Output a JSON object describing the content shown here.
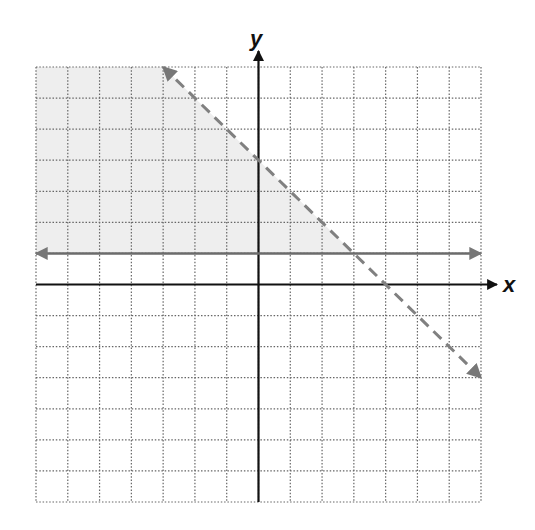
{
  "chart_data": {
    "type": "line",
    "title": "",
    "xlabel": "x",
    "ylabel": "y",
    "xlim": [
      -7,
      7
    ],
    "ylim": [
      -7,
      7
    ],
    "grid": true,
    "grid_style": "dotted",
    "tick_labels": false,
    "series": [
      {
        "name": "boundary y = 1",
        "style": "solid",
        "color": "#6b6b6b",
        "arrows": "both",
        "points": [
          [
            -7,
            1
          ],
          [
            7,
            1
          ]
        ]
      },
      {
        "name": "boundary y = -x + 4",
        "style": "dashed",
        "color": "#808080",
        "arrows": "both",
        "points": [
          [
            -3,
            7
          ],
          [
            7,
            -3
          ]
        ]
      }
    ],
    "shaded_region": {
      "description": "y >= 1 and x + y < 4",
      "color": "#eeeeee",
      "polygon": [
        [
          -7,
          1
        ],
        [
          3,
          1
        ],
        [
          -3,
          7
        ],
        [
          -7,
          7
        ]
      ]
    }
  },
  "labels": {
    "x_axis": "x",
    "y_axis": "y"
  }
}
